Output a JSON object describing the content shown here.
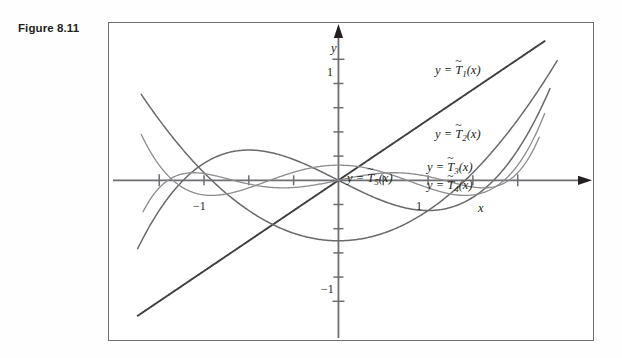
{
  "figure": {
    "caption": "Figure 8.11",
    "frame_color": "#6d6e71",
    "background": "#ffffff"
  },
  "axes": {
    "x_label": "x",
    "y_label": "y",
    "x_ticks": [
      {
        "value": -1,
        "label": "−1"
      },
      {
        "value": -0.75,
        "label": ""
      },
      {
        "value": -0.5,
        "label": ""
      },
      {
        "value": -0.25,
        "label": ""
      },
      {
        "value": 0.25,
        "label": ""
      },
      {
        "value": 0.5,
        "label": ""
      },
      {
        "value": 0.75,
        "label": ""
      },
      {
        "value": 1,
        "label": "1"
      }
    ],
    "y_ticks": [
      {
        "value": 1,
        "label": "1"
      },
      {
        "value": 0.8,
        "label": ""
      },
      {
        "value": 0.6,
        "label": ""
      },
      {
        "value": 0.4,
        "label": ""
      },
      {
        "value": 0.2,
        "label": ""
      },
      {
        "value": -0.2,
        "label": ""
      },
      {
        "value": -0.4,
        "label": ""
      },
      {
        "value": -0.6,
        "label": ""
      },
      {
        "value": -0.8,
        "label": ""
      },
      {
        "value": -1,
        "label": "−1"
      }
    ],
    "xlim": [
      -1.28,
      1.42
    ],
    "ylim": [
      -1.32,
      1.3
    ],
    "axis_color": "#6d6e71",
    "arrow_color": "#231f20"
  },
  "labels": {
    "t1": {
      "eq": "y =",
      "fn": "T",
      "sub": "1",
      "arg": "(x)"
    },
    "t2": {
      "eq": "y =",
      "fn": "T",
      "sub": "2",
      "arg": "(x)"
    },
    "t3": {
      "eq": "y =",
      "fn": "T",
      "sub": "3",
      "arg": "(x)"
    },
    "t4": {
      "eq": "y =",
      "fn": "T",
      "sub": "4",
      "arg": "(x)"
    },
    "t5": {
      "eq": "y =",
      "fn": "T",
      "sub": "5",
      "arg": "(x)"
    }
  },
  "chart_data": {
    "type": "line",
    "title": "",
    "xlabel": "x",
    "ylabel": "y",
    "xlim": [
      -1.28,
      1.42
    ],
    "ylim": [
      -1.32,
      1.3
    ],
    "grid": false,
    "legend": "inline-curve-labels",
    "series": [
      {
        "name": "y = T̃1(x)",
        "key": "t1",
        "formula": "x",
        "color": "#3f3f42",
        "width": 1.9,
        "domain": [
          -1.12,
          1.15
        ],
        "extrema": [
          -1.12,
          1.15
        ]
      },
      {
        "name": "y = T̃2(x)",
        "key": "t2",
        "formula": "x^2 - 1/2",
        "color": "#6a6a6d",
        "width": 1.5,
        "domain": [
          -1.1,
          1.22
        ],
        "extrema": [
          -0.5
        ]
      },
      {
        "name": "y = T̃3(x)",
        "key": "t3",
        "formula": "x^3 - (3/4)x",
        "color": "#6a6a6d",
        "width": 1.5,
        "domain": [
          -1.12,
          1.18
        ],
        "extrema": [
          0.25,
          -0.25
        ]
      },
      {
        "name": "y = T̃4(x)",
        "key": "t4",
        "formula": "x^4 - x^2 + 1/8",
        "color": "#8c8c8f",
        "width": 1.3,
        "domain": [
          -1.1,
          1.15
        ],
        "extrema": [
          0.125,
          -0.125
        ]
      },
      {
        "name": "y = T̃5(x)",
        "key": "t5",
        "formula": "x^5 - (5/4)x^3 + (5/16)x",
        "color": "#8c8c8f",
        "width": 1.3,
        "domain": [
          -1.09,
          1.12
        ],
        "extrema": [
          0.0625,
          -0.0625
        ]
      }
    ]
  }
}
